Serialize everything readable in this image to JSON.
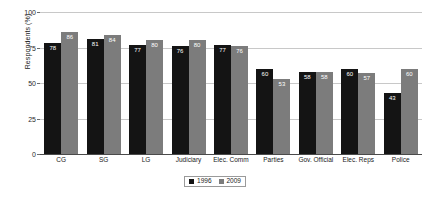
{
  "chart_data": {
    "type": "bar",
    "title": "",
    "xlabel": "",
    "ylabel": "Respondents (%)",
    "ylim": [
      0,
      100
    ],
    "yticks": [
      0,
      25,
      50,
      75,
      100
    ],
    "grid": true,
    "legend_position": "bottom-center",
    "categories": [
      "CG",
      "SG",
      "LG",
      "Judiciary",
      "Elec. Comm",
      "Parties",
      "Gov. Official",
      "Elec. Reps",
      "Police"
    ],
    "series": [
      {
        "name": "1996",
        "color": "#141414",
        "values": [
          78,
          81,
          77,
          76,
          77,
          60,
          58,
          60,
          43
        ]
      },
      {
        "name": "2009",
        "color": "#7c7c7c",
        "values": [
          86,
          84,
          80,
          80,
          76,
          53,
          58,
          57,
          60
        ]
      }
    ]
  },
  "axis": {
    "y_title": "Respondents (%)",
    "y_tick_labels": [
      "100",
      "75",
      "50",
      "25",
      "0"
    ]
  },
  "legend": {
    "items": [
      {
        "label": "1996"
      },
      {
        "label": "2009"
      }
    ]
  },
  "colors": {
    "series_1996": "#141414",
    "series_2009": "#7c7c7c",
    "gridline": "#c8c8c8",
    "axis": "#4a4a4a",
    "background": "#ffffff"
  }
}
